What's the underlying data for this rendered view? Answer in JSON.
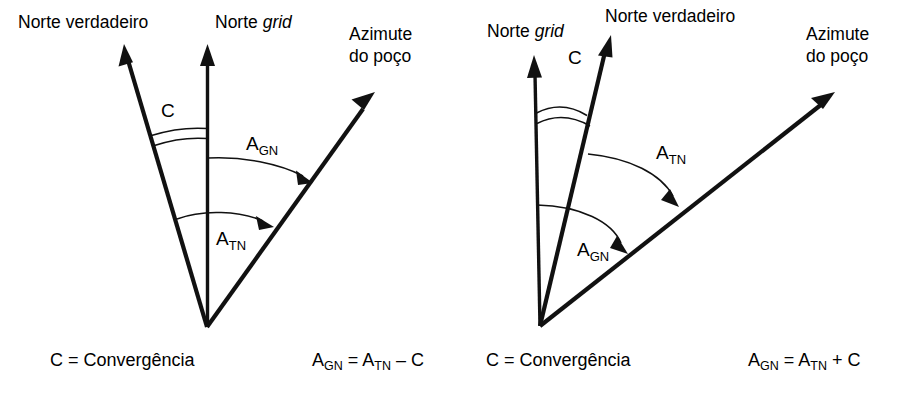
{
  "figure": {
    "background_color": "#ffffff",
    "ink_color": "#111111",
    "panel_count": 2
  },
  "panels": [
    {
      "id": "left",
      "name": "negative-convergence-case",
      "vertex": {
        "x": 207,
        "y": 327
      },
      "rays": [
        {
          "name": "true-north-ray",
          "label": "Norte verdadeiro",
          "label_italic_part": "",
          "label_x": 18,
          "label_y": 28,
          "tip": {
            "x": 124,
            "y": 47
          },
          "order": "left"
        },
        {
          "name": "grid-north-ray",
          "label": "Norte ",
          "label_italic_part": "grid",
          "label_x": 215,
          "label_y": 28,
          "tip": {
            "x": 207,
            "y": 47
          },
          "order": "middle"
        },
        {
          "name": "well-azimuth-ray",
          "label_line1": "Azimute",
          "label_line2": "do poço",
          "label_x": 349,
          "label_y": 40,
          "tip": {
            "x": 373,
            "y": 95
          },
          "order": "right"
        }
      ],
      "angles": [
        {
          "name": "convergence-angle",
          "label": "C",
          "label_x": 161,
          "label_y": 117,
          "style": "double-arc",
          "from": "true-north-ray",
          "to": "grid-north-ray"
        },
        {
          "name": "grid-azimuth-angle",
          "label_base": "A",
          "label_sub": "GN",
          "label_x": 246,
          "label_y": 150,
          "style": "arrow-arc",
          "from": "grid-north-ray",
          "to": "well-azimuth-ray"
        },
        {
          "name": "true-azimuth-angle",
          "label_base": "A",
          "label_sub": "TN",
          "label_x": 216,
          "label_y": 245,
          "style": "arrow-arc",
          "from": "true-north-ray",
          "to": "well-azimuth-ray"
        }
      ],
      "captions": [
        {
          "name": "convergence-definition",
          "text": "C = Convergência",
          "x": 50,
          "y": 366
        }
      ],
      "formula": {
        "name": "grid-azimuth-formula",
        "parts": [
          {
            "base": "A",
            "sub": "GN"
          },
          {
            "base": " = ",
            "sub": ""
          },
          {
            "base": "A",
            "sub": "TN"
          },
          {
            "base": " – C",
            "sub": ""
          }
        ],
        "plain": "A_GN = A_TN – C",
        "x": 312,
        "y": 366
      }
    },
    {
      "id": "right",
      "name": "positive-convergence-case",
      "vertex": {
        "x": 540,
        "y": 326
      },
      "rays": [
        {
          "name": "grid-north-ray",
          "label": "Norte ",
          "label_italic_part": "grid",
          "label_x": 487,
          "label_y": 37,
          "tip": {
            "x": 534,
            "y": 58
          },
          "order": "left"
        },
        {
          "name": "true-north-ray",
          "label": "Norte verdadeiro",
          "label_italic_part": "",
          "label_x": 605,
          "label_y": 22,
          "tip": {
            "x": 610,
            "y": 38
          },
          "order": "middle"
        },
        {
          "name": "well-azimuth-ray",
          "label_line1": "Azimute",
          "label_line2": "do poço",
          "label_x": 806,
          "label_y": 40,
          "tip": {
            "x": 833,
            "y": 95
          },
          "order": "right"
        }
      ],
      "angles": [
        {
          "name": "convergence-angle",
          "label": "C",
          "label_x": 568,
          "label_y": 64,
          "style": "double-arc",
          "from": "grid-north-ray",
          "to": "true-north-ray"
        },
        {
          "name": "true-azimuth-angle",
          "label_base": "A",
          "label_sub": "TN",
          "label_x": 656,
          "label_y": 159,
          "style": "arrow-arc",
          "from": "true-north-ray",
          "to": "well-azimuth-ray"
        },
        {
          "name": "grid-azimuth-angle",
          "label_base": "A",
          "label_sub": "GN",
          "label_x": 577,
          "label_y": 256,
          "style": "arrow-arc",
          "from": "grid-north-ray",
          "to": "well-azimuth-ray"
        }
      ],
      "captions": [
        {
          "name": "convergence-definition",
          "text": "C = Convergência",
          "x": 486,
          "y": 366
        }
      ],
      "formula": {
        "name": "grid-azimuth-formula",
        "parts": [
          {
            "base": "A",
            "sub": "GN"
          },
          {
            "base": " = ",
            "sub": ""
          },
          {
            "base": "A",
            "sub": "TN"
          },
          {
            "base": " + C",
            "sub": ""
          }
        ],
        "plain": "A_GN = A_TN + C",
        "x": 748,
        "y": 366
      }
    }
  ],
  "text": {
    "norte_verdadeiro": "Norte verdadeiro",
    "norte": "Norte ",
    "grid": "grid",
    "azimute": "Azimute",
    "do_poco": "do poço",
    "c": "C",
    "a": "A",
    "gn": "GN",
    "tn": "TN",
    "convergencia": "C = Convergência",
    "eq_minus_mid": " = ",
    "eq_minus_tail": " – C",
    "eq_plus_tail": " + C"
  }
}
